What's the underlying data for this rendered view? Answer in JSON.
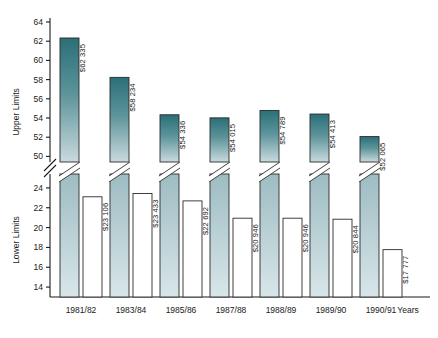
{
  "chart_data": {
    "type": "bar",
    "title": "",
    "subtitle": "",
    "xlabel": "Years",
    "ylabel_upper": "Upper Limits",
    "ylabel_lower": "Lower Limits",
    "grid": false,
    "legend": "none",
    "axis_break": true,
    "categories": [
      "1981/82",
      "1983/84",
      "1985/86",
      "1987/88",
      "1988/89",
      "1989/90",
      "1990/91"
    ],
    "upper_axis": {
      "ticks": [
        50,
        52,
        54,
        56,
        58,
        60,
        62,
        64
      ],
      "ylim": [
        49,
        64
      ]
    },
    "lower_axis": {
      "ticks": [
        14,
        16,
        18,
        20,
        22,
        24
      ],
      "ylim": [
        13,
        25
      ]
    },
    "series": [
      {
        "name": "Upper Limits",
        "unit": "thousands",
        "values": [
          62.335,
          58.234,
          54.336,
          54.015,
          54.789,
          54.413,
          52.065
        ],
        "labels": [
          "$62 335",
          "$58 234",
          "$54 336",
          "$54 015",
          "$54 789",
          "$54 413",
          "$52 065"
        ],
        "fill": "gradient-teal"
      },
      {
        "name": "Lower Limits",
        "unit": "thousands",
        "values": [
          23.106,
          23.433,
          22.692,
          20.946,
          20.946,
          20.844,
          17.777
        ],
        "labels": [
          "$23 106",
          "$23 433",
          "$22 692",
          "$20 946",
          "$20 946",
          "$20 844",
          "$17 777"
        ],
        "fill": "white"
      }
    ],
    "colors": {
      "bar_top": "#2b6f78",
      "bar_bottom": "#c6d8dc",
      "bar_outline": "#2b2b2b",
      "axis": "#1a1a1a",
      "label_text": "#1a1a1a",
      "background": "#ffffff"
    }
  }
}
